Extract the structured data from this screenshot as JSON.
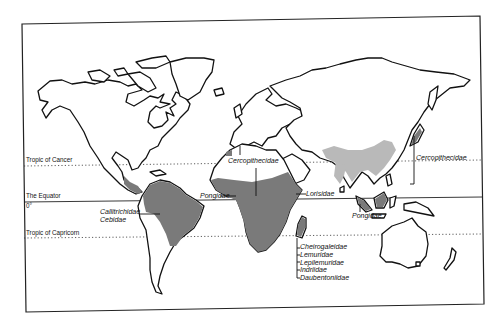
{
  "map": {
    "type": "world-outline",
    "latitude_lines": [
      {
        "label": "Tropic of Cancer",
        "style": "dotted"
      },
      {
        "label": "The Equator",
        "style": "solid",
        "degree_label": "0°"
      },
      {
        "label": "Tropic of Capricorn",
        "style": "dotted"
      }
    ],
    "families": {
      "new_world": [
        "Callitrichidae",
        "Cebidae"
      ],
      "africa_north": "Cercopithecidae",
      "africa_west": "Pongidae",
      "africa_east": "Lorisidae",
      "asia_east": "Cercopithecidae",
      "southeast_asia": "Pongidae",
      "madagascar": [
        "Cheirogaleidae",
        "Lemuridae",
        "Lepilemuridae",
        "Indriidae",
        "Daubentoniidae"
      ]
    },
    "colors": {
      "range_fill": "#7a7a7a",
      "range_speckle": "#b9b9b9",
      "outline": "#111111",
      "background": "#ffffff"
    }
  }
}
